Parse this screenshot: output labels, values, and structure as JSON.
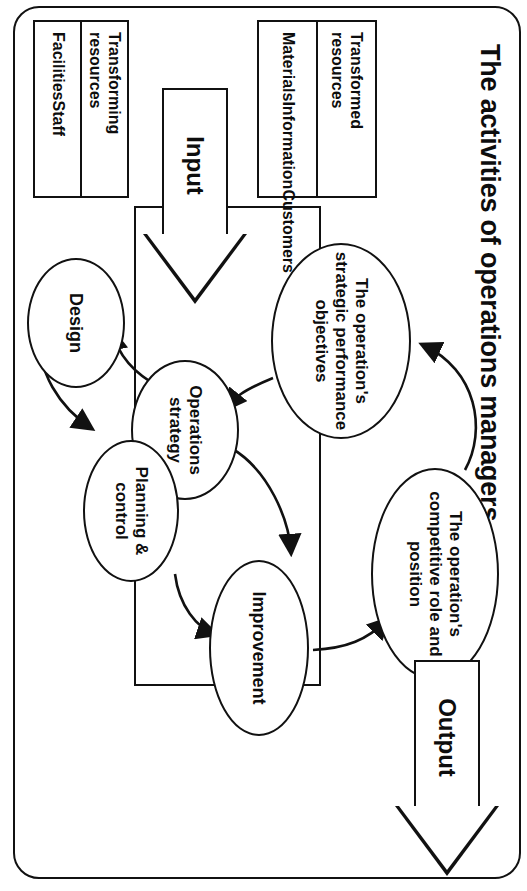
{
  "figure": {
    "title": "The activities of operations managers",
    "type": "input-transformation-output diagram"
  },
  "nodes": {
    "competitive_role": "The operation's competitive role and position",
    "strategic_objectives": "The operation's strategic performance objectives",
    "operations_strategy": "Operations strategy",
    "improvement": "Improvement",
    "planning_control": "Planning & control",
    "design": "Design"
  },
  "flow": {
    "input_label": "Input",
    "output_label": "Output"
  },
  "resources": {
    "transformed": {
      "heading": "Transformed resources",
      "items": "Materials\nInformation\nCustomers"
    },
    "transforming": {
      "heading": "Transforming resources",
      "items": "Facilities\nStaff"
    }
  },
  "colors": {
    "ink": "#111111",
    "background": "#ffffff"
  }
}
